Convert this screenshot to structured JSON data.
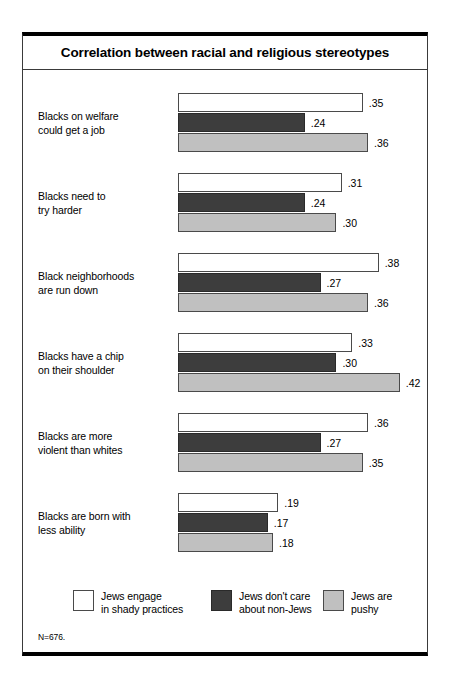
{
  "chart_data": {
    "type": "bar",
    "orientation": "horizontal",
    "title": "Correlation between racial and religious stereotypes",
    "xlabel": "",
    "ylabel": "",
    "xlim": [
      0,
      0.42
    ],
    "grid": false,
    "legend_position": "bottom",
    "footnote": "N=676.",
    "categories": [
      "Blacks on welfare could get a job",
      "Blacks need to try harder",
      "Black neighborhoods are run down",
      "Blacks have a chip on their shoulder",
      "Blacks are more violent than whites",
      "Blacks are born with less ability"
    ],
    "category_lines": [
      [
        "Blacks on welfare",
        "could get a job"
      ],
      [
        "Blacks need to",
        "try harder"
      ],
      [
        "Black neighborhoods",
        "are run down"
      ],
      [
        "Blacks have a chip",
        "on their shoulder"
      ],
      [
        "Blacks are more",
        "violent than whites"
      ],
      [
        "Blacks are born with",
        "less ability"
      ]
    ],
    "series": [
      {
        "name": "Jews engage in shady practices",
        "name_lines": [
          "Jews engage",
          "in shady practices"
        ],
        "color": "#ffffff",
        "values": [
          0.35,
          0.31,
          0.38,
          0.33,
          0.36,
          0.19
        ],
        "labels": [
          ".35",
          ".31",
          ".38",
          ".33",
          ".36",
          ".19"
        ]
      },
      {
        "name": "Jews don't care about non-Jews",
        "name_lines": [
          "Jews don't care",
          "about non-Jews"
        ],
        "color": "#3d3d3d",
        "values": [
          0.24,
          0.24,
          0.27,
          0.3,
          0.27,
          0.17
        ],
        "labels": [
          ".24",
          ".24",
          ".27",
          ".30",
          ".27",
          ".17"
        ]
      },
      {
        "name": "Jews are pushy",
        "name_lines": [
          "Jews are",
          "pushy"
        ],
        "color": "#c0c0c0",
        "values": [
          0.36,
          0.3,
          0.36,
          0.42,
          0.35,
          0.18
        ],
        "labels": [
          ".36",
          ".30",
          ".36",
          ".42",
          ".35",
          ".18"
        ]
      }
    ]
  },
  "legend": {
    "items": [
      {
        "label": "Jews engage\nin shady practices",
        "swatch": "s0"
      },
      {
        "label": "Jews don't care\nabout non-Jews",
        "swatch": "s1"
      },
      {
        "label": "Jews are\npushy",
        "swatch": "s2"
      }
    ]
  }
}
